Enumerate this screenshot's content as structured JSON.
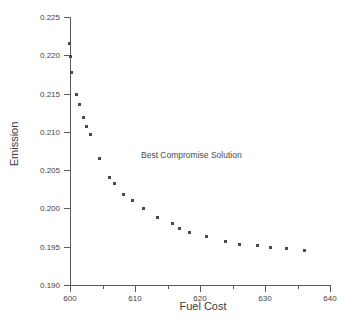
{
  "chart_data": {
    "type": "scatter",
    "title": "",
    "xlabel": "Fuel Cost",
    "ylabel": "Emission",
    "xlim": [
      596,
      640
    ],
    "ylim": [
      0.19,
      0.225
    ],
    "xticks": [
      600,
      610,
      620,
      630,
      640
    ],
    "xtick_labels": [
      "600",
      "610",
      "620",
      "630",
      "640"
    ],
    "xminor_ticks": [
      605,
      615,
      625,
      635
    ],
    "yticks": [
      0.19,
      0.195,
      0.2,
      0.205,
      0.21,
      0.215,
      0.22,
      0.225
    ],
    "ytick_labels": [
      "0.190",
      "0.195",
      "0.200",
      "0.205",
      "0.210",
      "0.215",
      "0.220",
      "0.225"
    ],
    "grid": false,
    "legend": null,
    "marker": "square",
    "marker_color": "#4a4a4a",
    "annotations": [
      {
        "text": "Best Compromise Solution",
        "x": 614.5,
        "y": 0.2063
      }
    ],
    "series": [
      {
        "name": "Pareto front",
        "x": [
          599.9,
          600.0,
          600.2,
          601.0,
          601.4,
          602.0,
          602.5,
          603.1,
          604.5,
          606.0,
          606.9,
          608.3,
          609.6,
          611.3,
          613.4,
          615.7,
          616.9,
          618.4,
          621.0,
          623.9,
          626.1,
          628.9,
          630.8,
          633.3,
          636.1
        ],
        "y": [
          0.2215,
          0.2199,
          0.2178,
          0.2149,
          0.2136,
          0.2119,
          0.2107,
          0.2097,
          0.2065,
          0.2041,
          0.2032,
          0.2018,
          0.2011,
          0.2,
          0.1988,
          0.198,
          0.1974,
          0.1969,
          0.1964,
          0.1957,
          0.1953,
          0.1951,
          0.1949,
          0.1948,
          0.1945
        ]
      }
    ]
  },
  "axis_titles": {
    "x": "Fuel Cost",
    "y": "Emission"
  }
}
